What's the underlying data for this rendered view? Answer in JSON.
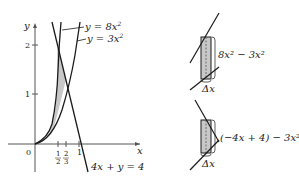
{
  "diagram": {
    "main_graph": {
      "axis_labels": {
        "x": "x",
        "y": "y",
        "origin": "0"
      },
      "y_ticks": [
        "1",
        "2"
      ],
      "x_ticks": [
        {
          "num": "1",
          "den": "2"
        },
        {
          "num": "2",
          "den": "3"
        },
        {
          "label": "1"
        }
      ],
      "curves": [
        {
          "label_prefix": "y = 8x",
          "exp": "2"
        },
        {
          "label_prefix": "y = 3x",
          "exp": "2"
        },
        {
          "label": "4x + y = 4"
        }
      ],
      "shaded_region": "between y=8x^2, y=3x^2, and 4x+y=4"
    },
    "strip_top": {
      "height_label": "8x² − 3x²",
      "width_label": "Δx"
    },
    "strip_bottom": {
      "height_label": "(−4x + 4) − 3x²",
      "width_label": "Δx"
    },
    "colors": {
      "stroke": "#1a1a1a",
      "shade": "#c8c8c8",
      "axis": "#555555"
    }
  }
}
